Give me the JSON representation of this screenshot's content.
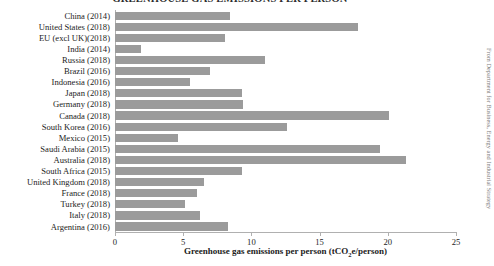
{
  "chart_data": {
    "type": "bar",
    "orientation": "horizontal",
    "title": "GREENHOUSE GAS EMISSIONS PER PERSON",
    "xlabel": "Greenhouse gas emissions per person (tCO2e/person)",
    "ylabel": "",
    "xlim": [
      0,
      25
    ],
    "xticks": [
      0,
      5,
      10,
      15,
      20,
      25
    ],
    "xticklabels": [
      "0",
      "5",
      "10",
      "15",
      "20",
      "25"
    ],
    "grid": false,
    "legend": null,
    "bar_color": "#9b9b9b",
    "categories": [
      "China (2014)",
      "United States (2018)",
      "EU (excl UK)(2018)",
      "India (2014)",
      "Russia (2018)",
      "Brazil (2016)",
      "Indonesia (2016)",
      "Japan (2018)",
      "Germany (2018)",
      "Canada (2018)",
      "South Korea (2016)",
      "Mexico (2015)",
      "Saudi Arabia (2015)",
      "Australia (2018)",
      "South Africa (2015)",
      "United Kingdom (2018)",
      "France (2018)",
      "Turkey (2018)",
      "Italy (2018)",
      "Argentina (2016)"
    ],
    "values": [
      8.4,
      17.8,
      8.1,
      1.9,
      11.0,
      7.0,
      5.5,
      9.3,
      9.4,
      20.1,
      12.6,
      4.6,
      19.4,
      21.3,
      9.3,
      6.5,
      6.0,
      5.1,
      6.2,
      8.3
    ]
  },
  "credit": {
    "text": "From Department for Business, Energy and Industrial Strategy"
  }
}
